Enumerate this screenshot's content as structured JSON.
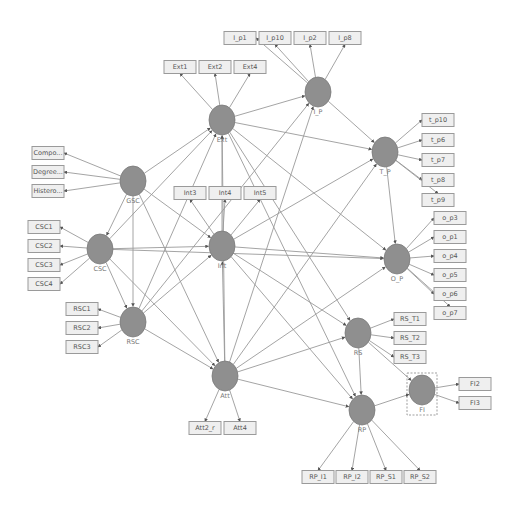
{
  "diagram": {
    "type": "PLS-SEM path model",
    "latent_variables": [
      {
        "id": "Ext",
        "label": "Ext",
        "x": 222,
        "y": 120
      },
      {
        "id": "I_P",
        "label": "I_P",
        "x": 318,
        "y": 92
      },
      {
        "id": "T_P",
        "label": "T_P",
        "x": 385,
        "y": 152
      },
      {
        "id": "GSC",
        "label": "GSC",
        "x": 133,
        "y": 181
      },
      {
        "id": "CSC",
        "label": "CSC",
        "x": 100,
        "y": 249
      },
      {
        "id": "Int",
        "label": "Int",
        "x": 222,
        "y": 246
      },
      {
        "id": "O_P",
        "label": "O_P",
        "x": 397,
        "y": 259
      },
      {
        "id": "RSC",
        "label": "RSC",
        "x": 133,
        "y": 322
      },
      {
        "id": "RS",
        "label": "RS",
        "x": 358,
        "y": 333
      },
      {
        "id": "Att",
        "label": "Att",
        "x": 225,
        "y": 376
      },
      {
        "id": "FI",
        "label": "FI",
        "x": 422,
        "y": 390
      },
      {
        "id": "RP",
        "label": "RP",
        "x": 362,
        "y": 410
      }
    ],
    "indicators": [
      {
        "label": "Ext1",
        "x": 180,
        "y": 67,
        "lv": "Ext"
      },
      {
        "label": "Ext2",
        "x": 215,
        "y": 67,
        "lv": "Ext"
      },
      {
        "label": "Ext4",
        "x": 250,
        "y": 67,
        "lv": "Ext"
      },
      {
        "label": "I_p1",
        "x": 240,
        "y": 38,
        "lv": "I_P"
      },
      {
        "label": "I_p10",
        "x": 275,
        "y": 38,
        "lv": "I_P"
      },
      {
        "label": "I_p2",
        "x": 310,
        "y": 38,
        "lv": "I_P"
      },
      {
        "label": "I_p8",
        "x": 345,
        "y": 38,
        "lv": "I_P"
      },
      {
        "label": "t_p10",
        "x": 438,
        "y": 120,
        "lv": "T_P"
      },
      {
        "label": "t_p6",
        "x": 438,
        "y": 140,
        "lv": "T_P"
      },
      {
        "label": "t_p7",
        "x": 438,
        "y": 160,
        "lv": "T_P"
      },
      {
        "label": "t_p8",
        "x": 438,
        "y": 180,
        "lv": "T_P"
      },
      {
        "label": "t_p9",
        "x": 438,
        "y": 200,
        "lv": "T_P"
      },
      {
        "label": "Compo...",
        "x": 48,
        "y": 153,
        "lv": "GSC"
      },
      {
        "label": "Degree...",
        "x": 48,
        "y": 172,
        "lv": "GSC"
      },
      {
        "label": "Histero...",
        "x": 48,
        "y": 191,
        "lv": "GSC"
      },
      {
        "label": "Int3",
        "x": 190,
        "y": 193,
        "lv": "Int"
      },
      {
        "label": "Int4",
        "x": 225,
        "y": 193,
        "lv": "Int"
      },
      {
        "label": "Int5",
        "x": 260,
        "y": 193,
        "lv": "Int"
      },
      {
        "label": "CSC1",
        "x": 44,
        "y": 227,
        "lv": "CSC"
      },
      {
        "label": "CSC2",
        "x": 44,
        "y": 246,
        "lv": "CSC"
      },
      {
        "label": "CSC3",
        "x": 44,
        "y": 265,
        "lv": "CSC"
      },
      {
        "label": "CSC4",
        "x": 44,
        "y": 284,
        "lv": "CSC"
      },
      {
        "label": "o_p3",
        "x": 450,
        "y": 218,
        "lv": "O_P"
      },
      {
        "label": "o_p1",
        "x": 450,
        "y": 237,
        "lv": "O_P"
      },
      {
        "label": "o_p4",
        "x": 450,
        "y": 256,
        "lv": "O_P"
      },
      {
        "label": "o_p5",
        "x": 450,
        "y": 275,
        "lv": "O_P"
      },
      {
        "label": "o_p6",
        "x": 450,
        "y": 294,
        "lv": "O_P"
      },
      {
        "label": "o_p7",
        "x": 450,
        "y": 313,
        "lv": "O_P"
      },
      {
        "label": "RSC1",
        "x": 82,
        "y": 309,
        "lv": "RSC"
      },
      {
        "label": "RSC2",
        "x": 82,
        "y": 328,
        "lv": "RSC"
      },
      {
        "label": "RSC3",
        "x": 82,
        "y": 347,
        "lv": "RSC"
      },
      {
        "label": "RS_T1",
        "x": 410,
        "y": 319,
        "lv": "RS"
      },
      {
        "label": "RS_T2",
        "x": 410,
        "y": 338,
        "lv": "RS"
      },
      {
        "label": "RS_T3",
        "x": 410,
        "y": 357,
        "lv": "RS"
      },
      {
        "label": "FI2",
        "x": 475,
        "y": 384,
        "lv": "FI"
      },
      {
        "label": "FI3",
        "x": 475,
        "y": 403,
        "lv": "FI"
      },
      {
        "label": "Att2_r",
        "x": 205,
        "y": 428,
        "lv": "Att"
      },
      {
        "label": "Att4",
        "x": 240,
        "y": 428,
        "lv": "Att"
      },
      {
        "label": "RP_I1",
        "x": 318,
        "y": 477,
        "lv": "RP"
      },
      {
        "label": "RP_I2",
        "x": 352,
        "y": 477,
        "lv": "RP"
      },
      {
        "label": "RP_S1",
        "x": 386,
        "y": 477,
        "lv": "RP"
      },
      {
        "label": "RP_S2",
        "x": 420,
        "y": 477,
        "lv": "RP"
      }
    ],
    "paths": [
      [
        "Ext",
        "I_P"
      ],
      [
        "Ext",
        "T_P"
      ],
      [
        "Ext",
        "O_P"
      ],
      [
        "Ext",
        "RS"
      ],
      [
        "Ext",
        "RP"
      ],
      [
        "I_P",
        "T_P"
      ],
      [
        "T_P",
        "O_P"
      ],
      [
        "GSC",
        "Ext"
      ],
      [
        "GSC",
        "CSC"
      ],
      [
        "GSC",
        "RSC"
      ],
      [
        "GSC",
        "Int"
      ],
      [
        "GSC",
        "Att"
      ],
      [
        "CSC",
        "Ext"
      ],
      [
        "CSC",
        "Int"
      ],
      [
        "CSC",
        "RSC"
      ],
      [
        "CSC",
        "Att"
      ],
      [
        "CSC",
        "O_P"
      ],
      [
        "Int",
        "Ext"
      ],
      [
        "Int",
        "T_P"
      ],
      [
        "Int",
        "O_P"
      ],
      [
        "Int",
        "RS"
      ],
      [
        "Int",
        "RP"
      ],
      [
        "RSC",
        "Int"
      ],
      [
        "RSC",
        "Att"
      ],
      [
        "RSC",
        "Ext"
      ],
      [
        "RSC",
        "I_P"
      ],
      [
        "Att",
        "Int"
      ],
      [
        "Att",
        "I_P"
      ],
      [
        "Att",
        "T_P"
      ],
      [
        "Att",
        "O_P"
      ],
      [
        "Att",
        "RS"
      ],
      [
        "Att",
        "RP"
      ],
      [
        "Att",
        "Ext"
      ],
      [
        "RS",
        "RP"
      ],
      [
        "RS",
        "FI"
      ],
      [
        "RP",
        "FI"
      ]
    ],
    "selected_node": "FI"
  }
}
